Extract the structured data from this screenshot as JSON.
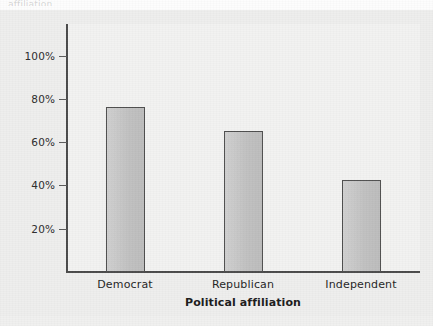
{
  "figure": {
    "background_color": "#eeeeed",
    "plot_background_color": "#f2f2f1",
    "axis_color": "#4a4a4a",
    "bar_fill_color": "#c6c6c6",
    "bar_edge_color": "#4f4f4f",
    "caption_remnant": "affiliation"
  },
  "chart_data": {
    "type": "bar",
    "title": "",
    "subtitle": "",
    "xlabel": "Political affiliation",
    "ylabel": "",
    "categories": [
      "Democrat",
      "Republican",
      "Independent"
    ],
    "values": [
      76,
      65,
      42.5
    ],
    "value_labels": [
      "",
      "",
      ""
    ],
    "ylim": [
      0,
      110
    ],
    "ytick_values": [
      20,
      40,
      60,
      80,
      100
    ],
    "ytick_labels": [
      "20%",
      "40%",
      "60%",
      "80%",
      "100%"
    ],
    "xtick_labels": [
      "Democrat",
      "Republican",
      "Independent"
    ],
    "grid": false,
    "legend": false,
    "legend_position": "none",
    "series": [
      {
        "name": "Percent",
        "values": [
          76,
          65,
          42.5
        ]
      }
    ]
  }
}
